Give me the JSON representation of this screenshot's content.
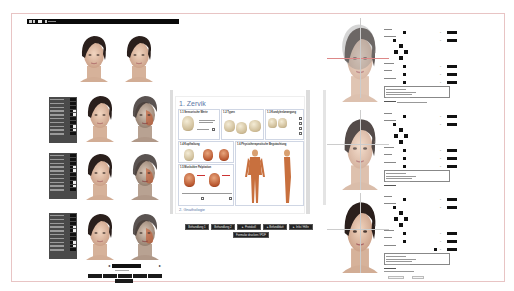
{
  "topbar": {
    "items": [
      {
        "icon": "grid-icon",
        "label": "▦ ▯"
      },
      {
        "icon": "chat-icon",
        "label": ""
      },
      {
        "icon": "user-icon",
        "label": ""
      }
    ]
  },
  "left_column": {
    "rows": [
      {
        "panel": false,
        "faces": [
          "neutral-face",
          "neutral-face"
        ]
      },
      {
        "panel": true,
        "faces": [
          "neutral-face",
          "anatomy-overlay-face"
        ]
      },
      {
        "panel": true,
        "faces": [
          "neutral-face",
          "anatomy-overlay-face"
        ]
      },
      {
        "panel": true,
        "faces": [
          "neutral-face",
          "anatomy-overlay-face"
        ]
      }
    ],
    "pager": {
      "prev": "◂",
      "next": "▸"
    },
    "bottom_buttons_count": 6
  },
  "document": {
    "title": "1. Zervik",
    "sections": [
      {
        "id": "1.1",
        "title": "1.1 Sensorische Werte"
      },
      {
        "id": "1.2",
        "title": "1.2 Typen"
      },
      {
        "id": "1.3",
        "title": "1.3 Kondylenbewegung"
      },
      {
        "id": "1.4",
        "title": "1.4 Kopfhaltung"
      },
      {
        "id": "1.5",
        "title": "1.5 Muskuläre Palpitation"
      },
      {
        "id": "1.6",
        "title": "1.6 Physiotherapeutische Begutachtung"
      }
    ],
    "next_heading": "2. Gnathologie"
  },
  "center_buttons": {
    "row1": [
      "Behandlung 1",
      "Behandlung 2",
      "▸ Protokoll",
      "▸ Befundblatt",
      "▸ Info / Hilfe"
    ],
    "row2": [
      "Formular drucken / PDF"
    ]
  },
  "right_forms": [
    {
      "face": "overlay-face-1"
    },
    {
      "face": "overlay-face-2"
    },
    {
      "face": "overlay-face-3"
    }
  ],
  "colors": {
    "frame_border": "#e8c4c4",
    "topbar": "#0a0a0a",
    "doc_title": "#5a78a8",
    "button_bg": "#222222"
  }
}
